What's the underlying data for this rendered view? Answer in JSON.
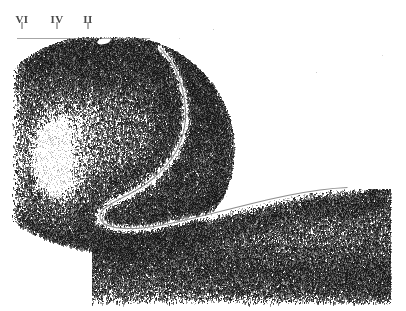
{
  "figure": {
    "type": "histological-micrograph",
    "stain": "Nissl",
    "structure": "hippocampal-formation-section",
    "background_color": "#ffffff",
    "tissue_color": "#3a3a3a",
    "width": 406,
    "height": 311
  },
  "labels": {
    "tick_color": "#5b5b5b",
    "text_color": "#4a4a4a",
    "items": [
      {
        "text": "VI",
        "x": 22,
        "label_y": 14,
        "tick_y": 22,
        "tick_height": 7
      },
      {
        "text": "IV",
        "x": 57,
        "label_y": 14,
        "tick_y": 22,
        "tick_height": 7
      },
      {
        "text": "II",
        "x": 88,
        "label_y": 14,
        "tick_y": 22,
        "tick_height": 7
      }
    ]
  },
  "chart_data": {
    "type": "heatmap",
    "title": "",
    "xlabel": "",
    "ylabel": "",
    "axis_labels": [
      "VI",
      "IV",
      "II"
    ],
    "axis_label_positions_px": [
      22,
      57,
      88
    ],
    "grid": false,
    "legend": "none",
    "regions": [
      {
        "name": "cortical-ribbon-upper",
        "density": 0.78,
        "path": "hook-curve-upper-left"
      },
      {
        "name": "hippocampal-fissure",
        "density": 0.02,
        "path": "white-cleft-diagonal"
      },
      {
        "name": "dentate-blade-right",
        "density": 0.7,
        "path": "elongated-arc-lower-right"
      },
      {
        "name": "white-matter-left",
        "density": 0.12,
        "path": "pale-wedge-left-margin"
      }
    ]
  }
}
